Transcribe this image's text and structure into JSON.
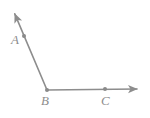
{
  "figure": {
    "kind": "geometry-angle-diagram",
    "background_color": "#ffffff",
    "stroke_color": "#8d8d8d",
    "label_color": "#8d8d8d",
    "dot_color": "#8a8a8a",
    "stroke_width": 1.6,
    "width": 150,
    "height": 118
  },
  "points": [
    {
      "id": "A",
      "label": "A",
      "dot": {
        "cx": 24,
        "cy": 36,
        "r": 2.0
      },
      "label_pos": {
        "x": 11,
        "y": 33
      }
    },
    {
      "id": "B",
      "label": "B",
      "dot": {
        "cx": 47,
        "cy": 90,
        "r": 2.0
      },
      "label_pos": {
        "x": 41,
        "y": 94
      }
    },
    {
      "id": "C",
      "label": "C",
      "dot": {
        "cx": 105,
        "cy": 89,
        "r": 2.0
      },
      "label_pos": {
        "x": 101,
        "y": 94
      }
    }
  ],
  "rays": [
    {
      "id": "ray-BA",
      "name": "ray-b-to-a",
      "from": {
        "x": 47,
        "y": 90
      },
      "to": {
        "x": 14,
        "y": 12
      },
      "arrow_at": "to"
    },
    {
      "id": "ray-BC",
      "name": "ray-b-to-c",
      "from": {
        "x": 47,
        "y": 90
      },
      "to": {
        "x": 139,
        "y": 89
      },
      "arrow_at": "to"
    }
  ],
  "arrowheads": [
    {
      "id": "arrow-BA",
      "tip": {
        "x": 13,
        "y": 10
      }
    },
    {
      "id": "arrow-BC",
      "tip": {
        "x": 140,
        "y": 89
      }
    }
  ]
}
